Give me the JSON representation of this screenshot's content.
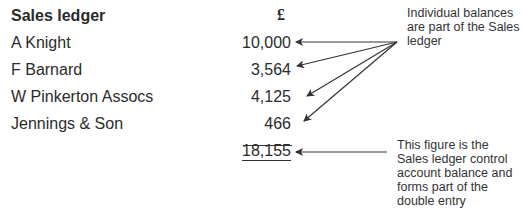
{
  "ledger": {
    "title": "Sales ledger",
    "currency": "£",
    "entries": [
      {
        "name": "A Knight",
        "amount": "10,000"
      },
      {
        "name": "F Barnard",
        "amount": "3,564"
      },
      {
        "name": "W Pinkerton Assocs",
        "amount": "4,125"
      },
      {
        "name": "Jennings & Son",
        "amount": "466"
      }
    ],
    "total": "18,155"
  },
  "annotations": {
    "individual_balances": "Individual balances are part of the Sales ledger",
    "control_account": "This figure is the Sales ledger control account balance and forms part of the double entry"
  }
}
